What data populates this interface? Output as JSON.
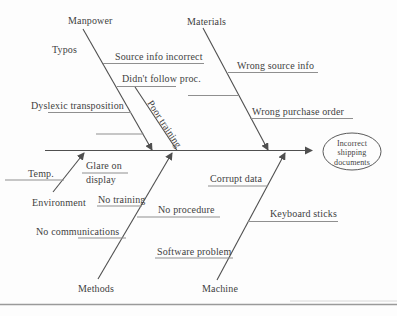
{
  "colors": {
    "background": "#fdfdfd",
    "bone_line": "#4f4f4f",
    "cause_underline": "#8f8f8f",
    "text": "#3f3f3f",
    "bottom_rule": "#9a9a9a"
  },
  "fishbone": {
    "effect_lines": [
      "Incorrect",
      "shipping",
      "documents"
    ],
    "branches": [
      {
        "category": "Manpower",
        "causes": [
          "Typos",
          "Source info incorrect",
          "Didn't follow proc.",
          "Dyslexic transposition",
          "Poor training"
        ]
      },
      {
        "category": "Materials",
        "causes": [
          "Wrong source info",
          "Wrong purchase order"
        ]
      },
      {
        "category": "Environment",
        "causes": [
          "Temp.",
          [
            "Glare on",
            "display"
          ]
        ]
      },
      {
        "category": "Methods",
        "causes": [
          "No training",
          "No procedure",
          "No communications"
        ]
      },
      {
        "category": "Machine",
        "causes": [
          "Corrupt data",
          "Keyboard sticks",
          "Software problem"
        ]
      }
    ]
  }
}
